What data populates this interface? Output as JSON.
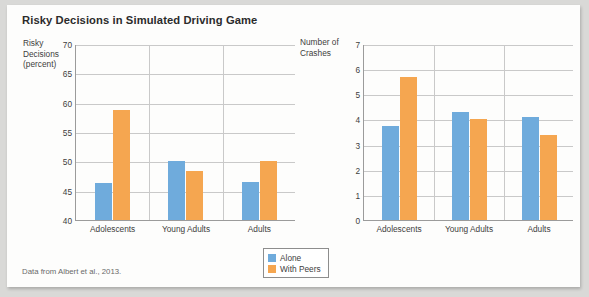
{
  "figure": {
    "title": "Risky Decisions in Simulated Driving Game",
    "source_note": "Data from Albert et al., 2013."
  },
  "legend": {
    "items": [
      {
        "label": "Alone",
        "color": "#6fabdc"
      },
      {
        "label": "With Peers",
        "color": "#f5a650"
      }
    ]
  },
  "chart_data": [
    {
      "type": "bar",
      "title": "Risky Decisions in Simulated Driving Game",
      "panel": "left",
      "ylabel": "Risky Decisions (percent)",
      "ylabel_lines": "Risky\nDecisions\n(percent)",
      "xlabel": "",
      "ylim": [
        40,
        70
      ],
      "yticks": [
        70,
        65,
        60,
        55,
        50,
        45,
        40
      ],
      "ytick_labels": [
        "70",
        "65",
        "60",
        "55",
        "50",
        "45",
        "40"
      ],
      "grid": true,
      "legend_position": "bottom-center",
      "categories": [
        "Adolescents",
        "Young Adults",
        "Adults"
      ],
      "series": [
        {
          "name": "Alone",
          "color": "#6fabdc",
          "values": [
            46.3,
            50.0,
            46.4
          ]
        },
        {
          "name": "With Peers",
          "color": "#f5a650",
          "values": [
            58.8,
            48.4,
            50.0
          ]
        }
      ]
    },
    {
      "type": "bar",
      "panel": "right",
      "ylabel": "Number of Crashes",
      "ylabel_lines": "Number of\nCrashes",
      "xlabel": "",
      "ylim": [
        0,
        7
      ],
      "yticks": [
        7,
        6,
        5,
        4,
        3,
        2,
        1,
        0
      ],
      "ytick_labels": [
        "7",
        "6",
        "5",
        "4",
        "3",
        "2",
        "1",
        "0"
      ],
      "grid": true,
      "legend_position": "bottom-center",
      "categories": [
        "Adolescents",
        "Young Adults",
        "Adults"
      ],
      "series": [
        {
          "name": "Alone",
          "color": "#6fabdc",
          "values": [
            3.75,
            4.3,
            4.1
          ]
        },
        {
          "name": "With Peers",
          "color": "#f5a650",
          "values": [
            5.7,
            4.0,
            3.4
          ]
        }
      ]
    }
  ]
}
